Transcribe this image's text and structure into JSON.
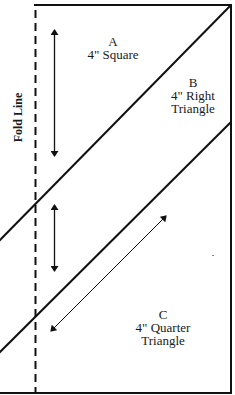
{
  "diagram": {
    "type": "quilt-template",
    "fold_line": {
      "label": "Fold Line",
      "style": "dashed"
    },
    "pieces": [
      {
        "id": "A",
        "letter": "A",
        "description": "4\" Square"
      },
      {
        "id": "B",
        "letter": "B",
        "line1": "4\" Right",
        "line2": "Triangle"
      },
      {
        "id": "C",
        "letter": "C",
        "line1": "4\" Quarter",
        "line2": "Triangle"
      }
    ],
    "colors": {
      "line": "#111111",
      "background": "#ffffff",
      "text": "#1a1a1a"
    }
  }
}
